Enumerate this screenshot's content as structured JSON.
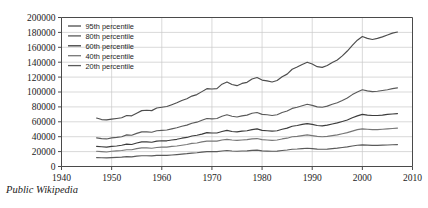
{
  "caption": "Public Wikipedia",
  "chart_data": {
    "type": "line",
    "title": "",
    "xlabel": "",
    "ylabel": "",
    "xlim": [
      1940,
      2010
    ],
    "ylim": [
      0,
      200000
    ],
    "grid": true,
    "legend_position": "top-left",
    "xticks": [
      1940,
      1950,
      1960,
      1970,
      1980,
      1990,
      2000,
      2010
    ],
    "yticks": [
      0,
      20000,
      40000,
      60000,
      80000,
      100000,
      120000,
      140000,
      160000,
      180000,
      200000
    ],
    "x": [
      1947,
      1948,
      1949,
      1950,
      1951,
      1952,
      1953,
      1954,
      1955,
      1956,
      1957,
      1958,
      1959,
      1960,
      1961,
      1962,
      1963,
      1964,
      1965,
      1966,
      1967,
      1968,
      1969,
      1970,
      1971,
      1972,
      1973,
      1974,
      1975,
      1976,
      1977,
      1978,
      1979,
      1980,
      1981,
      1982,
      1983,
      1984,
      1985,
      1986,
      1987,
      1988,
      1989,
      1990,
      1991,
      1992,
      1993,
      1994,
      1995,
      1996,
      1997,
      1998,
      1999,
      2000,
      2001,
      2002,
      2003,
      2004,
      2005,
      2006,
      2007
    ],
    "series": [
      {
        "name": "95th percentile",
        "color": "#4d4d4d",
        "values": [
          65000,
          63000,
          62500,
          63500,
          64500,
          65500,
          68500,
          68000,
          71500,
          75000,
          75500,
          75000,
          78500,
          79500,
          80500,
          83000,
          85500,
          88500,
          91000,
          94500,
          96500,
          100500,
          104500,
          104000,
          104500,
          110500,
          113500,
          110000,
          108500,
          111500,
          113000,
          117500,
          119500,
          116000,
          115000,
          113500,
          115500,
          120500,
          124000,
          130500,
          133500,
          137000,
          140000,
          137500,
          134000,
          133000,
          135500,
          139500,
          143000,
          148500,
          155000,
          162500,
          169500,
          174500,
          172000,
          170500,
          172000,
          174000,
          176500,
          179000,
          180500
        ]
      },
      {
        "name": "80th percentile",
        "color": "#5a5a5a",
        "values": [
          38500,
          37500,
          37000,
          38500,
          39000,
          40000,
          42500,
          42000,
          44500,
          46500,
          46500,
          46000,
          48000,
          48500,
          49000,
          50500,
          52000,
          54000,
          55500,
          58000,
          59500,
          62000,
          64500,
          64000,
          64500,
          67500,
          69500,
          67500,
          66500,
          68000,
          69000,
          71500,
          72500,
          70000,
          69500,
          68500,
          69500,
          72500,
          74500,
          78000,
          79500,
          81500,
          83500,
          82000,
          80000,
          79500,
          81000,
          83500,
          85500,
          88500,
          92000,
          96500,
          100000,
          103000,
          101500,
          100500,
          101000,
          102000,
          103000,
          104500,
          105500
        ]
      },
      {
        "name": "60th percentile",
        "color": "#3c3c3c",
        "values": [
          27000,
          26500,
          26000,
          27000,
          27500,
          28500,
          30000,
          29500,
          31500,
          33000,
          33000,
          32500,
          34000,
          34500,
          34500,
          35500,
          36500,
          38000,
          39000,
          41000,
          42000,
          43500,
          45500,
          45000,
          45000,
          47000,
          48500,
          47000,
          46500,
          47500,
          48000,
          49500,
          50500,
          48500,
          48000,
          47500,
          48000,
          50000,
          51500,
          54000,
          55000,
          56500,
          57500,
          56500,
          55000,
          54500,
          55500,
          57000,
          58500,
          60500,
          62500,
          65500,
          68000,
          70000,
          69000,
          68500,
          68500,
          69000,
          70000,
          70500,
          71000
        ]
      },
      {
        "name": "40th percentile",
        "color": "#777777",
        "values": [
          20500,
          20000,
          19500,
          20500,
          21000,
          21500,
          22500,
          22500,
          24000,
          25000,
          25000,
          24500,
          25500,
          26000,
          26000,
          27000,
          27500,
          28500,
          29500,
          31000,
          31500,
          33000,
          34000,
          34000,
          34000,
          35500,
          36500,
          35500,
          35000,
          35500,
          36000,
          37000,
          37500,
          36000,
          35500,
          35000,
          35500,
          37000,
          38000,
          40000,
          40500,
          41500,
          42500,
          41500,
          40500,
          40000,
          40500,
          41500,
          42500,
          44000,
          45500,
          47500,
          49500,
          50500,
          50000,
          49500,
          49500,
          50000,
          50500,
          51000,
          51500
        ]
      },
      {
        "name": "20th percentile",
        "color": "#5a5a5a",
        "values": [
          12000,
          11800,
          11500,
          12000,
          12300,
          12600,
          13200,
          13000,
          13900,
          14500,
          14500,
          14200,
          14900,
          15000,
          15000,
          15500,
          16000,
          16600,
          17200,
          18000,
          18500,
          19300,
          20000,
          20000,
          20000,
          20800,
          21500,
          20800,
          20500,
          20800,
          21000,
          21600,
          22000,
          21000,
          20700,
          20400,
          20600,
          21500,
          22100,
          23200,
          23500,
          24000,
          24500,
          24000,
          23400,
          23100,
          23400,
          24000,
          24600,
          25500,
          26300,
          27500,
          28500,
          29000,
          28700,
          28400,
          28400,
          28600,
          28900,
          29200,
          29400
        ]
      }
    ]
  }
}
